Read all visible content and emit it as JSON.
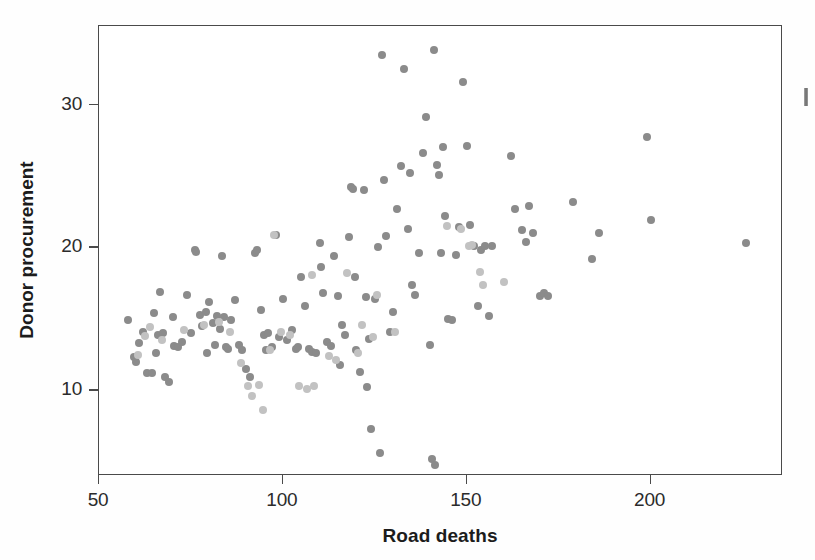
{
  "chart_data": {
    "type": "scatter",
    "title": "",
    "xlabel": "Road deaths",
    "ylabel": "Donor procurement",
    "xlim": [
      50,
      236
    ],
    "ylim": [
      4,
      35.5
    ],
    "xticks": [
      50,
      100,
      150,
      200
    ],
    "xticklabels": [
      "50",
      "100",
      "150",
      "200"
    ],
    "yticks": [
      10,
      20,
      30
    ],
    "yticklabels": [
      "10",
      "20",
      "30"
    ],
    "grid": false,
    "legend": null,
    "marker": "circle",
    "marker_size_px": 8,
    "colors": {
      "dark": "#8b8b8b",
      "light": "#c2c2c2",
      "frame": "#4a4a4a",
      "text": "#1c1c1c"
    },
    "series": [
      {
        "name": "dark",
        "color": "#8b8b8b",
        "points": [
          [
            58.0,
            14.9
          ],
          [
            59.5,
            12.3
          ],
          [
            60.0,
            12.0
          ],
          [
            61.0,
            13.3
          ],
          [
            62.0,
            14.1
          ],
          [
            63.0,
            11.2
          ],
          [
            64.5,
            11.2
          ],
          [
            65.0,
            15.4
          ],
          [
            65.5,
            12.6
          ],
          [
            66.0,
            13.9
          ],
          [
            66.5,
            16.9
          ],
          [
            67.5,
            14.0
          ],
          [
            68.0,
            10.9
          ],
          [
            69.0,
            10.6
          ],
          [
            70.0,
            15.1
          ],
          [
            70.5,
            13.1
          ],
          [
            71.5,
            13.0
          ],
          [
            72.5,
            13.4
          ],
          [
            74.0,
            16.7
          ],
          [
            75.0,
            14.0
          ],
          [
            76.0,
            19.8
          ],
          [
            76.5,
            19.7
          ],
          [
            77.5,
            15.3
          ],
          [
            78.0,
            14.5
          ],
          [
            79.0,
            15.5
          ],
          [
            79.5,
            12.6
          ],
          [
            80.0,
            16.2
          ],
          [
            81.0,
            14.7
          ],
          [
            81.5,
            13.2
          ],
          [
            82.0,
            15.2
          ],
          [
            83.0,
            14.3
          ],
          [
            83.5,
            19.4
          ],
          [
            84.0,
            15.1
          ],
          [
            84.5,
            13.0
          ],
          [
            85.0,
            12.9
          ],
          [
            86.0,
            14.9
          ],
          [
            87.0,
            16.3
          ],
          [
            88.0,
            13.2
          ],
          [
            89.0,
            12.8
          ],
          [
            90.0,
            11.5
          ],
          [
            91.0,
            10.9
          ],
          [
            92.5,
            19.6
          ],
          [
            93.0,
            19.8
          ],
          [
            94.0,
            15.6
          ],
          [
            95.0,
            13.9
          ],
          [
            95.5,
            12.8
          ],
          [
            96.0,
            14.0
          ],
          [
            97.0,
            13.0
          ],
          [
            98.0,
            20.9
          ],
          [
            99.0,
            13.7
          ],
          [
            100.0,
            16.4
          ],
          [
            101.0,
            13.5
          ],
          [
            102.5,
            14.2
          ],
          [
            103.5,
            12.9
          ],
          [
            104.0,
            13.0
          ],
          [
            105.0,
            17.9
          ],
          [
            106.0,
            15.9
          ],
          [
            107.0,
            12.9
          ],
          [
            108.0,
            12.7
          ],
          [
            109.0,
            12.6
          ],
          [
            110.0,
            20.3
          ],
          [
            110.5,
            18.6
          ],
          [
            111.0,
            16.8
          ],
          [
            112.0,
            13.4
          ],
          [
            113.0,
            13.1
          ],
          [
            114.0,
            19.4
          ],
          [
            115.0,
            16.6
          ],
          [
            115.5,
            11.8
          ],
          [
            116.0,
            14.6
          ],
          [
            117.0,
            13.9
          ],
          [
            118.0,
            20.7
          ],
          [
            118.5,
            24.2
          ],
          [
            119.0,
            24.1
          ],
          [
            119.5,
            17.9
          ],
          [
            120.0,
            12.8
          ],
          [
            121.0,
            11.3
          ],
          [
            122.0,
            24.0
          ],
          [
            122.5,
            16.5
          ],
          [
            123.0,
            10.2
          ],
          [
            123.5,
            13.6
          ],
          [
            124.0,
            7.3
          ],
          [
            125.0,
            16.4
          ],
          [
            126.0,
            20.0
          ],
          [
            126.5,
            5.6
          ],
          [
            127.0,
            33.5
          ],
          [
            127.5,
            24.7
          ],
          [
            128.0,
            20.8
          ],
          [
            129.0,
            14.1
          ],
          [
            130.0,
            15.5
          ],
          [
            131.0,
            22.7
          ],
          [
            132.0,
            25.7
          ],
          [
            133.0,
            32.5
          ],
          [
            134.0,
            21.3
          ],
          [
            134.5,
            25.2
          ],
          [
            135.0,
            17.4
          ],
          [
            136.0,
            16.7
          ],
          [
            137.0,
            19.6
          ],
          [
            138.0,
            26.6
          ],
          [
            139.0,
            29.1
          ],
          [
            140.0,
            13.2
          ],
          [
            140.5,
            5.2
          ],
          [
            141.0,
            33.8
          ],
          [
            141.5,
            4.8
          ],
          [
            142.0,
            25.8
          ],
          [
            142.5,
            25.1
          ],
          [
            143.0,
            19.6
          ],
          [
            143.5,
            27.0
          ],
          [
            144.0,
            22.2
          ],
          [
            145.0,
            15.0
          ],
          [
            146.0,
            14.9
          ],
          [
            147.0,
            19.5
          ],
          [
            148.0,
            21.4
          ],
          [
            149.0,
            31.6
          ],
          [
            150.0,
            27.1
          ],
          [
            151.0,
            21.6
          ],
          [
            152.0,
            20.1
          ],
          [
            153.0,
            15.9
          ],
          [
            154.0,
            19.8
          ],
          [
            155.0,
            20.1
          ],
          [
            156.0,
            15.2
          ],
          [
            157.0,
            20.1
          ],
          [
            162.0,
            26.4
          ],
          [
            163.0,
            22.7
          ],
          [
            165.0,
            21.2
          ],
          [
            166.0,
            20.4
          ],
          [
            167.0,
            22.9
          ],
          [
            168.0,
            21.0
          ],
          [
            170.0,
            16.6
          ],
          [
            171.0,
            16.8
          ],
          [
            172.0,
            16.6
          ],
          [
            179.0,
            23.2
          ],
          [
            184.0,
            19.2
          ],
          [
            186.0,
            21.0
          ],
          [
            199.0,
            27.7
          ],
          [
            200.0,
            21.9
          ],
          [
            226.0,
            20.3
          ]
        ]
      },
      {
        "name": "light",
        "color": "#c2c2c2",
        "points": [
          [
            60.5,
            12.5
          ],
          [
            62.5,
            13.8
          ],
          [
            64.0,
            14.4
          ],
          [
            67.0,
            13.5
          ],
          [
            73.0,
            14.2
          ],
          [
            78.5,
            14.6
          ],
          [
            82.5,
            14.8
          ],
          [
            85.5,
            14.1
          ],
          [
            88.5,
            11.9
          ],
          [
            90.5,
            10.3
          ],
          [
            91.5,
            9.6
          ],
          [
            93.5,
            10.4
          ],
          [
            94.5,
            8.6
          ],
          [
            96.5,
            12.8
          ],
          [
            99.5,
            14.1
          ],
          [
            102.0,
            13.9
          ],
          [
            104.5,
            10.3
          ],
          [
            106.5,
            10.1
          ],
          [
            108.5,
            10.3
          ],
          [
            112.5,
            12.4
          ],
          [
            114.5,
            12.1
          ],
          [
            117.5,
            18.2
          ],
          [
            120.5,
            12.6
          ],
          [
            121.5,
            14.6
          ],
          [
            124.5,
            13.7
          ],
          [
            125.5,
            16.7
          ],
          [
            130.5,
            14.1
          ],
          [
            144.5,
            21.5
          ],
          [
            148.5,
            21.3
          ],
          [
            150.5,
            20.1
          ],
          [
            151.5,
            20.2
          ],
          [
            153.5,
            18.3
          ],
          [
            154.5,
            17.4
          ],
          [
            160.0,
            17.6
          ],
          [
            108.0,
            18.1
          ],
          [
            97.5,
            20.9
          ]
        ]
      }
    ]
  }
}
